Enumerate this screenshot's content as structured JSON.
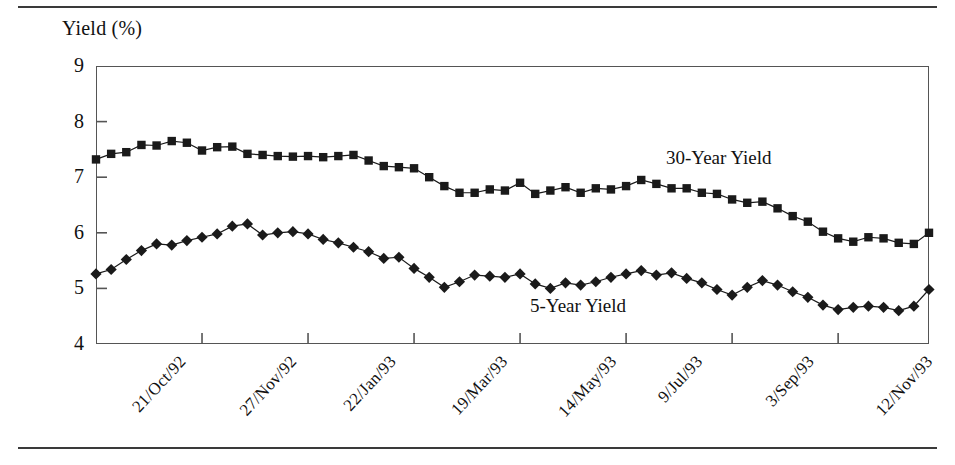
{
  "figure": {
    "axis_title": "Yield (%)",
    "frame": {
      "left": 96,
      "top": 66,
      "width": 833,
      "height": 278
    },
    "rules": {
      "top_y": 6,
      "bottom_y": 447
    }
  },
  "annotations": {
    "series_30y_label": "30-Year Yield",
    "series_5y_label": "5-Year Yield"
  },
  "caption": {
    "cut_off_text": ""
  },
  "chart_data": {
    "type": "line",
    "title": "",
    "subtitle": "",
    "xlabel": "",
    "ylabel": "Yield (%)",
    "ylim": [
      4,
      9
    ],
    "yticks": [
      4,
      5,
      6,
      7,
      8,
      9
    ],
    "ytick_labels": [
      "4",
      "5",
      "6",
      "7",
      "8",
      "9"
    ],
    "grid": false,
    "legend_position": "inline-annotation",
    "marker_30y": "filled-square",
    "marker_5y": "filled-diamond",
    "line_color": "#1a1a1a",
    "xtick_labels": [
      "21/Oct/92",
      "27/Nov/92",
      "22/Jan/93",
      "19/Mar/93",
      "14/May/93",
      "9/Jul/93",
      "3/Sep/93",
      "12/Nov/93"
    ],
    "xtick_indices": [
      0,
      7,
      14,
      21,
      28,
      35,
      42,
      49
    ],
    "n_points": 56,
    "series": [
      {
        "name": "30-Year Yield",
        "marker": "square",
        "values": [
          7.32,
          7.42,
          7.45,
          7.58,
          7.57,
          7.65,
          7.62,
          7.48,
          7.54,
          7.55,
          7.42,
          7.4,
          7.38,
          7.37,
          7.38,
          7.36,
          7.38,
          7.4,
          7.3,
          7.2,
          7.18,
          7.16,
          7.0,
          6.84,
          6.72,
          6.72,
          6.78,
          6.76,
          6.9,
          6.7,
          6.76,
          6.82,
          6.72,
          6.8,
          6.78,
          6.84,
          6.95,
          6.88,
          6.8,
          6.8,
          6.72,
          6.7,
          6.6,
          6.54,
          6.56,
          6.44,
          6.3,
          6.2,
          6.02,
          5.9,
          5.84,
          5.92,
          5.9,
          5.82,
          5.8,
          6.0
        ]
      },
      {
        "name": "5-Year Yield",
        "marker": "diamond",
        "values": [
          5.26,
          5.34,
          5.52,
          5.68,
          5.8,
          5.78,
          5.86,
          5.92,
          5.98,
          6.12,
          6.16,
          5.96,
          6.0,
          6.02,
          5.98,
          5.88,
          5.82,
          5.74,
          5.66,
          5.54,
          5.56,
          5.36,
          5.2,
          5.02,
          5.12,
          5.24,
          5.22,
          5.2,
          5.26,
          5.08,
          5.0,
          5.1,
          5.06,
          5.12,
          5.2,
          5.26,
          5.32,
          5.24,
          5.28,
          5.18,
          5.1,
          4.98,
          4.88,
          5.02,
          5.14,
          5.06,
          4.94,
          4.84,
          4.7,
          4.62,
          4.66,
          4.68,
          4.66,
          4.6,
          4.68,
          4.98
        ]
      }
    ]
  }
}
